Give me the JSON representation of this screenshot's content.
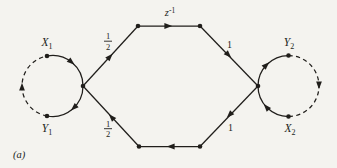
{
  "figure": {
    "caption": "(a)",
    "colors": {
      "ink": "#201e1b",
      "paper": "#f4f3ef"
    },
    "delay": {
      "base": "z",
      "exp": "-1"
    },
    "gains": {
      "top_left": {
        "num": "1",
        "den": "2"
      },
      "bottom_left": {
        "num": "1",
        "den": "2"
      },
      "top_right": "1",
      "bottom_right": "1"
    },
    "nodes": {
      "x1": {
        "base": "X",
        "sub": "1"
      },
      "y1": {
        "base": "Y",
        "sub": "1"
      },
      "y2": {
        "base": "Y",
        "sub": "2"
      },
      "x2": {
        "base": "X",
        "sub": "2"
      }
    }
  }
}
